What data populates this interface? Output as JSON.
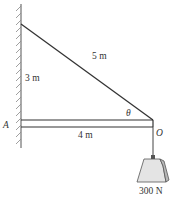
{
  "diagram": {
    "labels": {
      "cable_length": "5 m",
      "wall_height": "3 m",
      "beam_length": "4 m",
      "point_a": "A",
      "point_o": "O",
      "angle": "θ",
      "weight": "300 N"
    },
    "colors": {
      "line": "#333333",
      "hatch": "#777777",
      "weight_front": "#e4e4e4",
      "weight_side": "#b8b8b8"
    }
  }
}
